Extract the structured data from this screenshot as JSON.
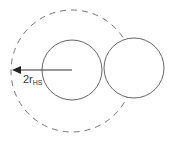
{
  "diagram": {
    "label_main": "2r",
    "label_sub": "HS",
    "colors": {
      "stroke": "#555555",
      "dashed": "#777777",
      "arrow": "#222222"
    }
  }
}
